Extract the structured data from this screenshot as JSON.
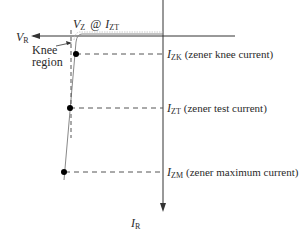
{
  "diagram": {
    "axes": {
      "horizontal": {
        "label": "V",
        "subscript": "R"
      },
      "vertical": {
        "label": "I",
        "subscript": "R"
      }
    },
    "top_annotation": {
      "v_label": "V",
      "v_sub": "Z",
      "at": "@",
      "i_label": "I",
      "i_sub": "ZT"
    },
    "knee_annotation": {
      "line1": "Knee",
      "line2": "region"
    },
    "points": [
      {
        "label": "I",
        "sub": "ZK",
        "desc": "(zener knee current)"
      },
      {
        "label": "I",
        "sub": "ZT",
        "desc": "(zener test current)"
      },
      {
        "label": "I",
        "sub": "ZM",
        "desc": "(zener maximum current)"
      }
    ],
    "colors": {
      "axis": "#333333",
      "curve": "#888888",
      "dashed": "#555555",
      "dot": "#000000"
    }
  }
}
